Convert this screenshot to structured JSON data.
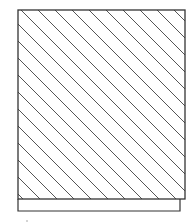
{
  "figure": {
    "hatch_pattern": "diagonal-lines",
    "stroke_color": "#333333",
    "hatch_color": "#555555",
    "background": "#ffffff"
  }
}
